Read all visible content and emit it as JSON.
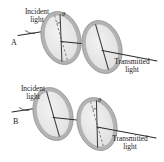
{
  "figure": {
    "background_color": "#ffffff",
    "colors": {
      "disc_ring": "#b3b3b3",
      "disc_ring_edge": "#8f8f8f",
      "disc_face": "#e9e9e9",
      "axis_line": "#3a3a3a",
      "ray_line": "#2b2b2b",
      "dashed_line": "#6e6e6e",
      "text": "#1a1a1a"
    }
  },
  "panels": [
    {
      "id": "A",
      "label": "A",
      "incident_label_line1": "Incident",
      "incident_label_line2": "light",
      "transmitted_label_line1": "Transmitted",
      "transmitted_label_line2": "light",
      "angle_symbol": "θ",
      "first_filter_axis": "tilted",
      "second_filter_axis": "vertical"
    },
    {
      "id": "B",
      "label": "B",
      "incident_label_line1": "Incident",
      "incident_label_line2": "light",
      "transmitted_label_line1": "Transmitted",
      "transmitted_label_line2": "light",
      "angle_symbol": "θ",
      "first_filter_axis": "vertical",
      "second_filter_axis": "tilted"
    }
  ]
}
